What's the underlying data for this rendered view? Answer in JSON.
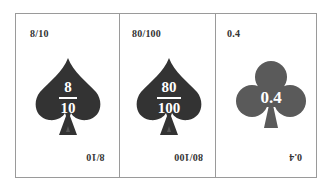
{
  "colors": {
    "spade": "#333333",
    "club": "#5a5a5a",
    "border": "#9a9a9a",
    "text": "#333333",
    "background": "#ffffff"
  },
  "cards": [
    {
      "suit": "spade",
      "icon": "spade-icon",
      "corner_top": "8/10",
      "corner_bottom": "8/10",
      "numerator": "8",
      "denominator": "10"
    },
    {
      "suit": "spade",
      "icon": "spade-icon",
      "corner_top": "80/100",
      "corner_bottom": "80/100",
      "numerator": "80",
      "denominator": "100"
    },
    {
      "suit": "club",
      "icon": "club-icon",
      "corner_top": "0.4",
      "corner_bottom": "0.4",
      "value": "0.4"
    }
  ]
}
